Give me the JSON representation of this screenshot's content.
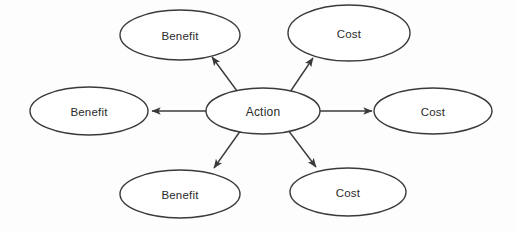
{
  "diagram": {
    "type": "hub-and-spoke",
    "canvas": {
      "width": 516,
      "height": 232,
      "background": "#fdfdfd"
    },
    "style": {
      "stroke_color": "#3a3a3a",
      "node_fill": "#ffffff",
      "text_color": "#2b2b2b",
      "stroke_width": 1.4
    },
    "center": {
      "id": "action",
      "label": "Action",
      "cx": 263,
      "cy": 111,
      "rx": 57,
      "ry": 23
    },
    "nodes": [
      {
        "id": "benefit-top-left",
        "label": "Benefit",
        "category": "benefit",
        "position": "top-left",
        "cx": 180,
        "cy": 35,
        "rx": 60,
        "ry": 25
      },
      {
        "id": "cost-top-right",
        "label": "Cost",
        "category": "cost",
        "position": "top-right",
        "cx": 349,
        "cy": 33,
        "rx": 61,
        "ry": 28
      },
      {
        "id": "benefit-left",
        "label": "Benefit",
        "category": "benefit",
        "position": "left",
        "cx": 89,
        "cy": 111,
        "rx": 59,
        "ry": 24
      },
      {
        "id": "cost-right",
        "label": "Cost",
        "category": "cost",
        "position": "right",
        "cx": 433,
        "cy": 111,
        "rx": 59,
        "ry": 23
      },
      {
        "id": "benefit-bottom-left",
        "label": "Benefit",
        "category": "benefit",
        "position": "bottom-left",
        "cx": 180,
        "cy": 194,
        "rx": 60,
        "ry": 24
      },
      {
        "id": "cost-bottom-right",
        "label": "Cost",
        "category": "cost",
        "position": "bottom-right",
        "cx": 348,
        "cy": 192,
        "rx": 58,
        "ry": 24
      }
    ],
    "arrows": [
      {
        "id": "arrow-to-benefit-top-left",
        "from": "action",
        "to": "benefit-top-left",
        "x1": 240,
        "y1": 95,
        "x2": 212,
        "y2": 57,
        "arrowhead": "filled-triangle"
      },
      {
        "id": "arrow-to-cost-top-right",
        "from": "action",
        "to": "cost-top-right",
        "x1": 288,
        "y1": 95,
        "x2": 313,
        "y2": 58,
        "arrowhead": "filled-triangle"
      },
      {
        "id": "arrow-to-benefit-left",
        "from": "action",
        "to": "benefit-left",
        "x1": 207,
        "y1": 111,
        "x2": 152,
        "y2": 111,
        "arrowhead": "filled-triangle"
      },
      {
        "id": "arrow-to-cost-right",
        "from": "action",
        "to": "cost-right",
        "x1": 320,
        "y1": 111,
        "x2": 372,
        "y2": 111,
        "arrowhead": "filled-triangle"
      },
      {
        "id": "arrow-to-benefit-bottom-left",
        "from": "action",
        "to": "benefit-bottom-left",
        "x1": 241,
        "y1": 130,
        "x2": 214,
        "y2": 168,
        "arrowhead": "filled-triangle"
      },
      {
        "id": "arrow-to-cost-bottom-right",
        "from": "action",
        "to": "cost-bottom-right",
        "x1": 288,
        "y1": 130,
        "x2": 316,
        "y2": 167,
        "arrowhead": "filled-triangle"
      }
    ]
  }
}
